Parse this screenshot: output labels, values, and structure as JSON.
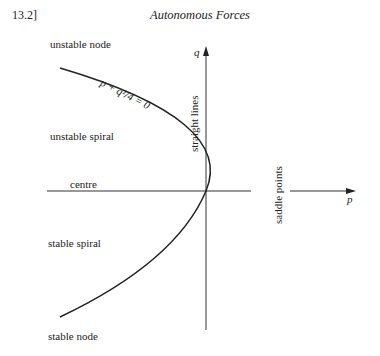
{
  "header": {
    "page_number": "13.2]",
    "running_head": "Autonomous Forces"
  },
  "figure": {
    "axes": {
      "x_label": "p",
      "y_label": "q"
    },
    "curve_label": "p + q²/4 = 0",
    "regions": {
      "unstable_node": "unstable node",
      "unstable_spiral": "unstable spiral",
      "centre": "centre",
      "stable_spiral": "stable spiral",
      "stable_node": "stable node",
      "straight_lines": "straight lines",
      "saddle_points": "saddle points"
    }
  }
}
